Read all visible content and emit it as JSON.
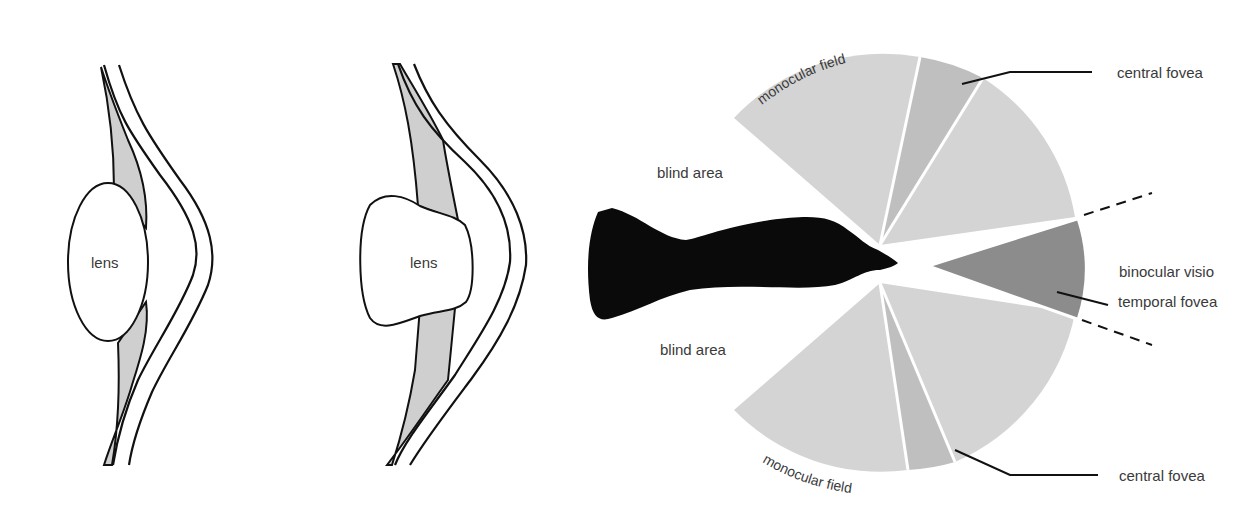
{
  "panels": {
    "eye_relaxed": {
      "lens_label": "lens"
    },
    "eye_accommodated": {
      "lens_label": "lens"
    },
    "visual_field": {
      "blind_area_top": "blind area",
      "blind_area_bottom": "blind area",
      "monocular_field_top": "monocular field",
      "monocular_field_bottom": "monocular field",
      "central_fovea_top": "central fovea",
      "central_fovea_bottom": "central fovea",
      "binocular_vision": "binocular visio",
      "temporal_fovea": "temporal fovea"
    }
  },
  "colors": {
    "ink": "#111111",
    "light_gray_field": "#d4d4d4",
    "mid_gray_fovea": "#bfbfbf",
    "dark_gray_binocular": "#8c8c8c",
    "tissue_gray": "#cfcfcf",
    "text": "#3a3a3a"
  }
}
